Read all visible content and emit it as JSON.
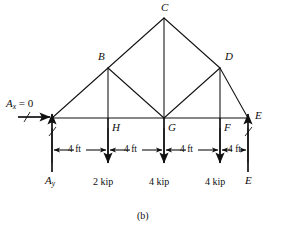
{
  "figure": {
    "caption": "(b)",
    "type": "truss-free-body-diagram"
  },
  "joints": {
    "A": {
      "label": "A",
      "x": 52,
      "y": 118
    },
    "B": {
      "label": "B",
      "x": 108,
      "y": 68
    },
    "C": {
      "label": "C",
      "x": 164,
      "y": 18
    },
    "D": {
      "label": "D",
      "x": 220,
      "y": 68
    },
    "E": {
      "label": "E",
      "x": 248,
      "y": 118
    },
    "F": {
      "label": "F",
      "x": 220,
      "y": 118
    },
    "G": {
      "label": "G",
      "x": 164,
      "y": 118
    },
    "H": {
      "label": "H",
      "x": 108,
      "y": 118
    }
  },
  "reactions": {
    "ax_label": "A",
    "ax_sub": "x",
    "ax_value": " = 0",
    "ay_label": "A",
    "ay_sub": "y",
    "e_joint_label": "E",
    "e_reaction_label": "E"
  },
  "loads": [
    {
      "at": "H",
      "label": "2 kip",
      "value": 2,
      "unit": "kip"
    },
    {
      "at": "G",
      "label": "4 kip",
      "value": 4,
      "unit": "kip"
    },
    {
      "at": "F",
      "label": "4 kip",
      "value": 4,
      "unit": "kip"
    }
  ],
  "dimensions": [
    {
      "label": "4 ft",
      "from": "A",
      "to": "H"
    },
    {
      "label": "4 ft",
      "from": "H",
      "to": "G"
    },
    {
      "label": "4 ft",
      "from": "G",
      "to": "F"
    },
    {
      "label": "4 ft",
      "from": "F",
      "to": "E"
    }
  ],
  "colors": {
    "line": "#111111",
    "background": "#ffffff"
  }
}
